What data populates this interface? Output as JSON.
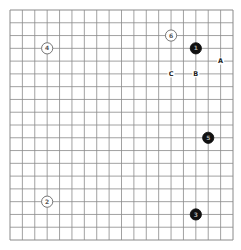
{
  "board": {
    "size": 19,
    "line_color": "#8a8a8a",
    "background": "#ffffff"
  },
  "stones": [
    {
      "move": "1",
      "color": "black",
      "col": 15,
      "row": 3
    },
    {
      "move": "2",
      "color": "white",
      "col": 3,
      "row": 15
    },
    {
      "move": "3",
      "color": "black",
      "col": 15,
      "row": 16
    },
    {
      "move": "4",
      "color": "white",
      "col": 3,
      "row": 3
    },
    {
      "move": "5",
      "color": "black",
      "col": 16,
      "row": 10
    },
    {
      "move": "6",
      "color": "white",
      "col": 13,
      "row": 2
    }
  ],
  "marks": [
    {
      "label": "A",
      "col": 17,
      "row": 4
    },
    {
      "label": "B",
      "col": 15,
      "row": 5
    },
    {
      "label": "C",
      "col": 13,
      "row": 5
    }
  ]
}
